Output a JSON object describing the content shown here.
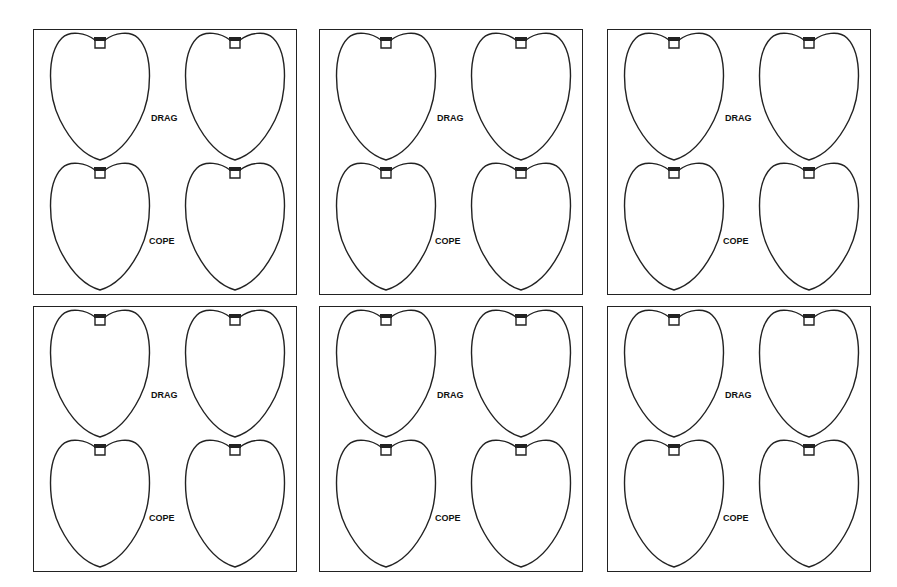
{
  "panels": [
    {
      "top_label": "DRAG",
      "bottom_label": "COPE"
    },
    {
      "top_label": "DRAG",
      "bottom_label": "COPE"
    },
    {
      "top_label": "DRAG",
      "bottom_label": "COPE"
    },
    {
      "top_label": "DRAG",
      "bottom_label": "COPE"
    },
    {
      "top_label": "DRAG",
      "bottom_label": "COPE"
    },
    {
      "top_label": "DRAG",
      "bottom_label": "COPE"
    }
  ],
  "colors": {
    "line": "#222222",
    "background": "#ffffff"
  }
}
